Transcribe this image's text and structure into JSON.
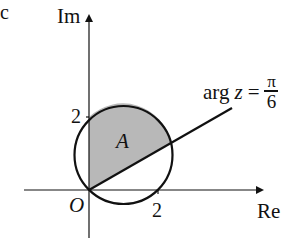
{
  "labels": {
    "corner": "c",
    "im_axis": "Im",
    "re_axis": "Re",
    "origin": "O",
    "im_tick": "2",
    "re_tick": "2",
    "region": "A",
    "line_label_prefix": "arg",
    "line_label_var": "z",
    "line_label_eq": "=",
    "line_label_num": "π",
    "line_label_den": "6"
  },
  "colors": {
    "stroke": "#111111",
    "shade": "#b8b8b8",
    "background": "#ffffff"
  },
  "geometry": {
    "circle_center": [
      1,
      1
    ],
    "circle_radius": "√2",
    "ray_angle": "π/6"
  }
}
